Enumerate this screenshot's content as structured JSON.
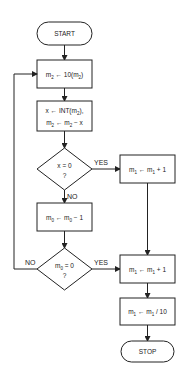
{
  "diagram": {
    "type": "flowchart",
    "colors": {
      "stroke": "#222222",
      "background": "#ffffff"
    },
    "nodes": {
      "start": {
        "shape": "terminal",
        "label": "START"
      },
      "scale_m2": {
        "shape": "process",
        "label_main": "m",
        "label_sub": "2",
        "text": "m2 ← 10(m2)"
      },
      "split_int": {
        "shape": "process",
        "line1": "x ← INT(m2),",
        "line2": "m2 ← m2 − x"
      },
      "check_x": {
        "shape": "decision",
        "line1": "x = 0",
        "line2": "?"
      },
      "inc_m1_a": {
        "shape": "process",
        "text": "m1 ← m1 + 1"
      },
      "dec_m0": {
        "shape": "process",
        "text": "m0 ← m0 − 1"
      },
      "check_m0": {
        "shape": "decision",
        "line1": "m0 = 0",
        "line2": "?"
      },
      "inc_m1_b": {
        "shape": "process",
        "text": "m1 ← m1 + 1"
      },
      "div_m1": {
        "shape": "process",
        "text": "m1 ← m1 / 10"
      },
      "stop": {
        "shape": "terminal",
        "label": "STOP"
      }
    },
    "edge_labels": {
      "check_x_yes": "YES",
      "check_x_no": "NO",
      "check_m0_yes": "YES",
      "check_m0_no": "NO"
    }
  }
}
